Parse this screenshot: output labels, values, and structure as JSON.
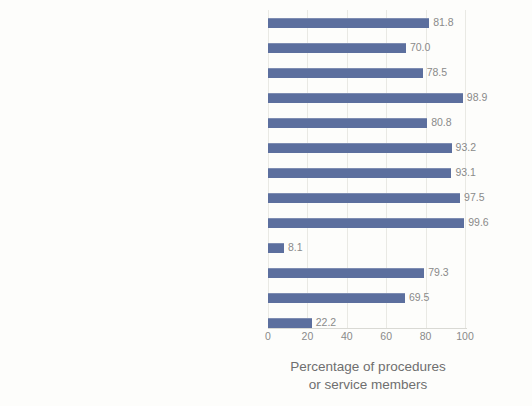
{
  "chart_data": {
    "type": "bar",
    "orientation": "horizontal",
    "title": "",
    "xlabel": "Percentage of procedures or service members",
    "xlabel_line1": "Percentage of procedures",
    "xlabel_line2": "or service members",
    "ylabel": "",
    "xlim": [
      0,
      100
    ],
    "xticks": [
      0,
      20,
      40,
      60,
      80,
      100
    ],
    "xticklabels": [
      "0",
      "20",
      "40",
      "60",
      "80",
      "100"
    ],
    "grid": true,
    "grid_axis": "x",
    "legend": false,
    "bar_color": "#5c6f9e",
    "text_color": "#6f6f6f",
    "value_label_color": "#8a8a8a",
    "background": "#fdfdfb",
    "categories": [
      "Acute pain: ambulatory procedures",
      "Acute low back pain: NSAIDs and/or NPT, no opioids",
      "Acute low back pain: stepped care",
      "Acute low back pain: no benzodiazepines",
      "Chronic pain: NPT",
      "Chronic pain: nonopioids and/or NPT",
      "Opioids: no concurrent benzodiazepines",
      "Opioids: lower-risk average dose",
      "Opioids: no advancement to LOT",
      "Opioids: naloxone in LOT, higher-risk dosage",
      "Opioids: follow-up visit in LOT",
      "Opioids: urine drug test in LOT",
      "OUD: medication treatment"
    ],
    "values": [
      81.8,
      70.0,
      78.5,
      98.9,
      80.8,
      93.2,
      93.1,
      97.5,
      99.6,
      8.1,
      79.3,
      69.5,
      22.2
    ],
    "value_labels": [
      "81.8",
      "70.0",
      "78.5",
      "98.9",
      "80.8",
      "93.2",
      "93.1",
      "97.5",
      "99.6",
      "8.1",
      "79.3",
      "69.5",
      "22.2"
    ]
  }
}
